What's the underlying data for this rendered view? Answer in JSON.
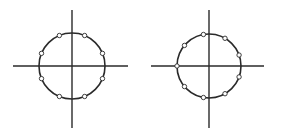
{
  "figure": {
    "colors": {
      "stroke": "#2a2a2a",
      "background": "#ffffff",
      "point_fill": "#ffffff"
    },
    "diagrams": [
      {
        "name": "left-circle-diagram",
        "center": [
          72,
          66
        ],
        "radius": 33,
        "h_axis": [
          13,
          128
        ],
        "v_axis": [
          10,
          128
        ],
        "point_count": 8,
        "point_angles_deg": [
          22.5,
          67.5,
          112.5,
          157.5,
          202.5,
          247.5,
          292.5,
          337.5
        ]
      },
      {
        "name": "right-circle-diagram",
        "center": [
          209,
          66
        ],
        "radius": 32,
        "h_axis": [
          151,
          264
        ],
        "v_axis": [
          10,
          128
        ],
        "point_count": 9,
        "point_angles_deg": [
          180,
          140,
          100,
          60,
          20,
          -20,
          -60,
          -100,
          -140
        ]
      }
    ]
  }
}
